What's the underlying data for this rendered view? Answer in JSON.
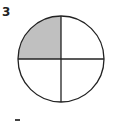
{
  "question": {
    "number": "3",
    "figure": {
      "type": "fraction-circle",
      "parts": 4,
      "shaded_parts": 1,
      "shaded_quadrant": "top-left",
      "shade_color": "#c0c0c0",
      "stroke_color": "#222222"
    }
  }
}
